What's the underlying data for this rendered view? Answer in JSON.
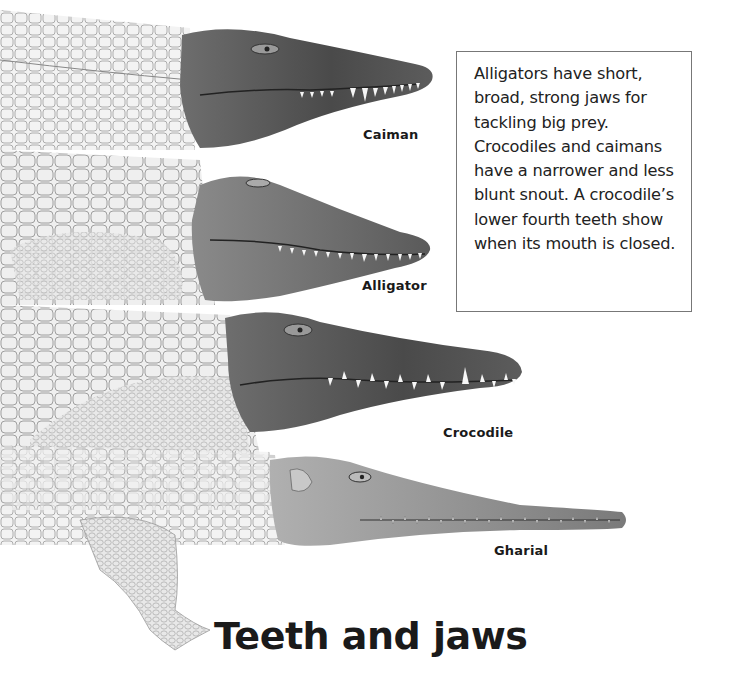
{
  "page": {
    "title": "Teeth and jaws"
  },
  "info_box": {
    "text": "Alligators have short, broad, strong jaws for tackling big prey. Crocodiles and caimans have a narrower and less blunt snout. A crocodile’s lower fourth teeth show when its mouth is closed."
  },
  "illustrations": [
    {
      "id": "caiman",
      "label": "Caiman"
    },
    {
      "id": "alligator",
      "label": "Alligator"
    },
    {
      "id": "crocodile",
      "label": "Crocodile"
    },
    {
      "id": "gharial",
      "label": "Gharial"
    }
  ],
  "colors": {
    "text": "#1a1a1a",
    "box_border": "#777777",
    "background": "#ffffff"
  }
}
